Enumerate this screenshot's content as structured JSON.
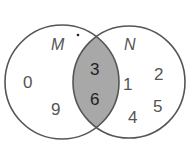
{
  "diagram": {
    "type": "venn",
    "sets": [
      {
        "label": "M",
        "only_elements": [
          "0",
          "9"
        ]
      },
      {
        "label": "N",
        "only_elements": [
          "1",
          "2",
          "4",
          "5"
        ]
      }
    ],
    "intersection": {
      "elements": [
        "3",
        "6"
      ],
      "shaded": true
    },
    "colors": {
      "outline": "#555555",
      "shade": "#a8a8a8",
      "background": "#ffffff"
    }
  },
  "labels": {
    "set_m": "M",
    "set_n": "N"
  },
  "elements": {
    "m_0": "0",
    "m_9": "9",
    "mn_3": "3",
    "mn_6": "6",
    "n_1": "1",
    "n_2": "2",
    "n_4": "4",
    "n_5": "5"
  }
}
